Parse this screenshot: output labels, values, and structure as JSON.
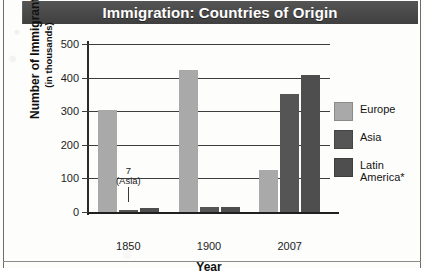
{
  "chart_data": {
    "type": "bar",
    "title": "Immigration: Countries of Origin",
    "xlabel": "Year",
    "ylabel": "Number of Immigrants",
    "ylabel_sub": "(in thousands)",
    "categories": [
      "1850",
      "1900",
      "2007"
    ],
    "ylim": [
      0,
      500
    ],
    "yticks": [
      0,
      100,
      200,
      300,
      400,
      500
    ],
    "ytick_labels": [
      "0",
      "100",
      "200",
      "300",
      "400",
      "500"
    ],
    "grid": true,
    "legend_position": "right",
    "series": [
      {
        "name": "Europe",
        "color": "#a9a9a9",
        "values": [
          305,
          424,
          125
        ]
      },
      {
        "name": "Asia",
        "color": "#555555",
        "values": [
          7,
          14,
          350
        ]
      },
      {
        "name": "Latin America*",
        "color": "#4e4e4e",
        "values": [
          13,
          14,
          408
        ]
      }
    ],
    "annotations": [
      {
        "label": "7\n(Asia)",
        "series": "Asia",
        "category": "1850",
        "value": 7
      }
    ]
  },
  "legend": {
    "items": [
      {
        "label": "Europe",
        "color": "#a9a9a9"
      },
      {
        "label": "Asia",
        "color": "#555555"
      },
      {
        "label": "Latin\nAmerica*",
        "color": "#4e4e4e"
      }
    ]
  },
  "annotation": {
    "asia_1850_value": "7",
    "asia_1850_name": "(Asia)"
  }
}
